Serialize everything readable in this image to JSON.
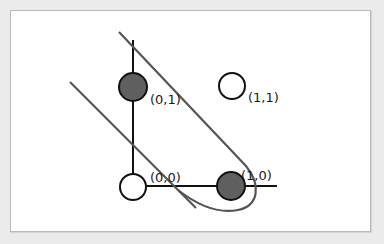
{
  "diagram": {
    "points": [
      {
        "label": "(0,1)",
        "x": 0,
        "y": 1,
        "style": "filled",
        "color": "#5f5f5f"
      },
      {
        "label": "(1,1)",
        "x": 1,
        "y": 1,
        "style": "hollow",
        "color": "#ffffff"
      },
      {
        "label": "(0,0)",
        "x": 0,
        "y": 0,
        "style": "hollow",
        "color": "#ffffff"
      },
      {
        "label": "(1,0)",
        "x": 1,
        "y": 0,
        "style": "filled",
        "color": "#5f5f5f"
      }
    ],
    "boundaries": [
      {
        "type": "straight-line",
        "color": "#555555"
      },
      {
        "type": "loop-curve",
        "color": "#555555"
      }
    ],
    "axes_color": "#111111"
  }
}
